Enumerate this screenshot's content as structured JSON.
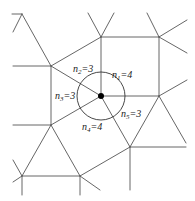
{
  "diagram": {
    "type": "tiling-vertex-figure",
    "colors": {
      "edge": "#555555",
      "circle": "#333333",
      "dot": "#000000",
      "text": "#222222"
    },
    "center": {
      "x": 101,
      "y": 96,
      "radius": 24
    },
    "labels": [
      {
        "id": "n1",
        "var": "n",
        "sub": "1",
        "value": "=4",
        "x": 112,
        "y": 78
      },
      {
        "id": "n2",
        "var": "n",
        "sub": "2",
        "value": "=3",
        "x": 73,
        "y": 72
      },
      {
        "id": "n3",
        "var": "n",
        "sub": "3",
        "value": "=3",
        "x": 55,
        "y": 99
      },
      {
        "id": "n4",
        "var": "n",
        "sub": "4",
        "value": "=4",
        "x": 82,
        "y": 130
      },
      {
        "id": "n5",
        "var": "n",
        "sub": "5",
        "value": "=3",
        "x": 121,
        "y": 117
      }
    ],
    "edges": [
      [
        101,
        96,
        101,
        37
      ],
      [
        101,
        96,
        51,
        66
      ],
      [
        101,
        96,
        51,
        125
      ],
      [
        101,
        96,
        130,
        147
      ],
      [
        101,
        96,
        159,
        96
      ],
      [
        101,
        37,
        159,
        37
      ],
      [
        159,
        37,
        159,
        96
      ],
      [
        51,
        66,
        51,
        125
      ],
      [
        51,
        66,
        101,
        37
      ],
      [
        159,
        96,
        130,
        147
      ],
      [
        159,
        96,
        186,
        143
      ],
      [
        130,
        147,
        186,
        147
      ],
      [
        51,
        125,
        22,
        176
      ],
      [
        51,
        125,
        80,
        176
      ],
      [
        22,
        176,
        80,
        176
      ],
      [
        80,
        176,
        130,
        147
      ],
      [
        22,
        14,
        51,
        66
      ],
      [
        22,
        14,
        13,
        32
      ],
      [
        22,
        14,
        12,
        14
      ],
      [
        101,
        37,
        88,
        13
      ],
      [
        101,
        37,
        114,
        13
      ],
      [
        159,
        37,
        147,
        13
      ],
      [
        159,
        37,
        187,
        20
      ],
      [
        159,
        37,
        187,
        53
      ],
      [
        159,
        96,
        187,
        80
      ],
      [
        51,
        66,
        13,
        66
      ],
      [
        51,
        125,
        13,
        125
      ],
      [
        22,
        176,
        13,
        160
      ],
      [
        22,
        176,
        13,
        182
      ],
      [
        22,
        176,
        22,
        195
      ],
      [
        80,
        176,
        100,
        190
      ],
      [
        80,
        176,
        80,
        195
      ],
      [
        130,
        147,
        130,
        190
      ]
    ]
  }
}
